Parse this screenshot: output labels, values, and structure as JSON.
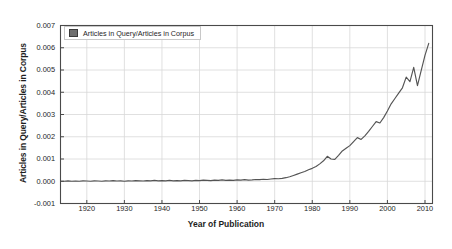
{
  "chart_data": {
    "type": "line",
    "title": "",
    "xlabel": "Year of Publication",
    "ylabel": "Articles in Query/Articles in Corpus",
    "legend": [
      "Articles in Query/Articles in Corpus"
    ],
    "legend_position": "upper-left-inside",
    "grid": true,
    "xlim": [
      1913,
      2012
    ],
    "ylim": [
      -0.001,
      0.007
    ],
    "xticks": [
      1920,
      1930,
      1940,
      1950,
      1960,
      1970,
      1980,
      1990,
      2000,
      2010
    ],
    "xtick_labels": [
      "1920",
      "1930",
      "1940",
      "1950",
      "1960",
      "1970",
      "1980",
      "1990",
      "2000",
      "2010"
    ],
    "yticks": [
      -0.001,
      0.0,
      0.001,
      0.002,
      0.003,
      0.004,
      0.005,
      0.006,
      0.007
    ],
    "ytick_labels": [
      "-0.001",
      "0.000",
      "0.001",
      "0.002",
      "0.003",
      "0.004",
      "0.005",
      "0.006",
      "0.007"
    ],
    "line_color": "#545454",
    "grid_color": "#d8d8d8",
    "axis_color": "#4a4a4a",
    "background": "#ffffff",
    "series": [
      {
        "name": "Articles in Query/Articles in Corpus",
        "x": [
          1913,
          1914,
          1915,
          1916,
          1917,
          1918,
          1919,
          1920,
          1921,
          1922,
          1923,
          1924,
          1925,
          1926,
          1927,
          1928,
          1929,
          1930,
          1931,
          1932,
          1933,
          1934,
          1935,
          1936,
          1937,
          1938,
          1939,
          1940,
          1941,
          1942,
          1943,
          1944,
          1945,
          1946,
          1947,
          1948,
          1949,
          1950,
          1951,
          1952,
          1953,
          1954,
          1955,
          1956,
          1957,
          1958,
          1959,
          1960,
          1961,
          1962,
          1963,
          1964,
          1965,
          1966,
          1967,
          1968,
          1969,
          1970,
          1971,
          1972,
          1973,
          1974,
          1975,
          1976,
          1977,
          1978,
          1979,
          1980,
          1981,
          1982,
          1983,
          1984,
          1985,
          1986,
          1987,
          1988,
          1989,
          1990,
          1991,
          1992,
          1993,
          1994,
          1995,
          1996,
          1997,
          1998,
          1999,
          2000,
          2001,
          2002,
          2003,
          2004,
          2005,
          2006,
          2007,
          2008,
          2009,
          2010,
          2011
        ],
        "y": [
          0.0,
          0.0,
          2e-05,
          0.0,
          1e-05,
          0.0,
          2e-05,
          1e-05,
          0.0,
          2e-05,
          1e-05,
          0.0,
          2e-05,
          1e-05,
          3e-05,
          1e-05,
          2e-05,
          0.0,
          2e-05,
          1e-05,
          3e-05,
          2e-05,
          1e-05,
          3e-05,
          2e-05,
          4e-05,
          2e-05,
          3e-05,
          2e-05,
          4e-05,
          2e-05,
          3e-05,
          2e-05,
          4e-05,
          3e-05,
          2e-05,
          4e-05,
          3e-05,
          5e-05,
          4e-05,
          3e-05,
          5e-05,
          4e-05,
          6e-05,
          4e-05,
          5e-05,
          4e-05,
          6e-05,
          5e-05,
          7e-05,
          5e-05,
          6e-05,
          8e-05,
          7e-05,
          9e-05,
          8e-05,
          0.0001,
          0.00012,
          0.00011,
          0.00013,
          0.00016,
          0.0002,
          0.00026,
          0.00032,
          0.00038,
          0.00044,
          0.00052,
          0.00058,
          0.00066,
          0.00078,
          0.00092,
          0.00112,
          0.001,
          0.00098,
          0.00116,
          0.00136,
          0.00148,
          0.0016,
          0.00178,
          0.00196,
          0.00188,
          0.00204,
          0.00224,
          0.00246,
          0.00268,
          0.00262,
          0.00286,
          0.00316,
          0.00348,
          0.00372,
          0.00396,
          0.0042,
          0.00468,
          0.00448,
          0.00512,
          0.0043,
          0.00498,
          0.00566,
          0.0062
        ]
      }
    ]
  },
  "figure": {
    "legend_label": "Articles in Query/Articles in Corpus",
    "xlabel": "Year of Publication",
    "ylabel": "Articles in Query/Articles in Corpus"
  }
}
